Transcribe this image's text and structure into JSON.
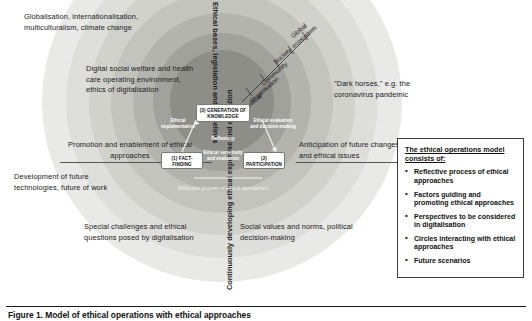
{
  "figure": {
    "caption": "Figure 1. Model of ethical operations with ethical approaches"
  },
  "rings": {
    "count": 7,
    "colors": [
      "#e9e9e7",
      "#dededa",
      "#d2d2cd",
      "#c4c4bf",
      "#b4b4ae",
      "#a2a29c",
      "#8e8e88"
    ]
  },
  "callouts": {
    "globalisation": "Globalisation, internationalisation, multiculturalism, climate change",
    "digital_welfare": "Digital social welfare and health care operating environment, ethics of digitalisation",
    "promotion": "Promotion and enablement of ethical approaches",
    "development": "Development of future technologies, future of work",
    "special_challenges": "Special challenges and ethical questions posed by digitalisation",
    "social_values": "Social values and norms, political decision-making",
    "anticipation": "Anticipation of future changes and ethical issues",
    "dark_horses": "\"Dark horses,\" e.g. the coronavirus pandemic"
  },
  "vertical_labels": {
    "top": "Ethical bases, legislation and guidelines",
    "bottom": "Continuously developing ethical expertise and education"
  },
  "scale_levels": [
    {
      "line1": "Global",
      "line2": "ecosystem"
    },
    {
      "line1": "Society",
      "line2": ""
    },
    {
      "line1": "Community",
      "line2": ""
    },
    {
      "line1": "Organisation",
      "line2": ""
    },
    {
      "line1": "Individual",
      "line2": ""
    }
  ],
  "model": {
    "nodes": [
      {
        "id": "knowledge",
        "number": "(3)",
        "label": "GENERATION OF KNOWLEDGE"
      },
      {
        "id": "fact_finding",
        "number": "(1)",
        "label": "FACT-FINDING"
      },
      {
        "id": "participation",
        "number": "(2)",
        "label": "PARTICIPATION"
      }
    ],
    "inner_labels": {
      "implementation": "Ethical implementation",
      "evaluation": "Ethical evaluation and decision-making",
      "reflexivity": "Reflexivity",
      "sensitivity": "Ethical sensitivity and evaluation",
      "core": "Reflective process of ethical approaches"
    }
  },
  "legend": {
    "title": "The ethical operations model consists of:",
    "items": [
      "Reflective process of ethical approaches",
      "Factors guiding and promoting ethical approaches",
      "Perspectives to be considered in digitalisation",
      "Circles interacting with ethical approaches",
      "Future scenarios"
    ]
  }
}
